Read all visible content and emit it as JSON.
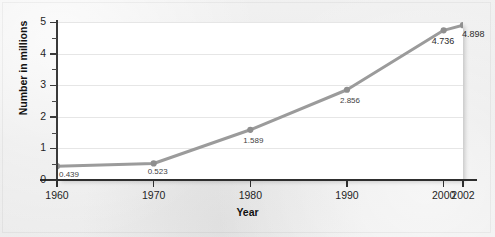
{
  "chart_data": {
    "type": "line",
    "title": "",
    "xlabel": "Year",
    "ylabel": "Number in millions",
    "x": [
      1960,
      1970,
      1980,
      1990,
      2000,
      2002
    ],
    "categories": [
      "1960",
      "1970",
      "1980",
      "1990",
      "2000",
      "2002"
    ],
    "values": [
      0.439,
      0.523,
      1.589,
      2.856,
      4.736,
      4.898
    ],
    "point_labels": [
      "0.439",
      "0.523",
      "1.589",
      "2.856",
      "4.736",
      "4.898"
    ],
    "xlim": [
      1960,
      2002
    ],
    "ylim": [
      0,
      5
    ],
    "y_ticks": [
      0,
      1,
      2,
      3,
      4,
      5
    ],
    "y_tick_labels": [
      "0",
      "1",
      "2",
      "3",
      "4",
      "5"
    ],
    "y_minor_ticks": [
      0.5,
      1.5,
      2.5,
      3.5,
      4.5
    ],
    "x_ticks": [
      1960,
      1970,
      1980,
      1990,
      2000,
      2002
    ],
    "x_tick_labels": [
      "1960",
      "1970",
      "1980",
      "1990",
      "2000",
      "2002"
    ],
    "grid": "horizontal",
    "legend": "none",
    "series": [
      {
        "name": "",
        "values": [
          0.439,
          0.523,
          1.589,
          2.856,
          4.736,
          4.898
        ],
        "line_color": "#9b9b9b",
        "marker_color": "#8f8f8f",
        "marker": "circle"
      }
    ]
  },
  "figure": {
    "plot_background": "#ffffff",
    "page_background": "#ececec",
    "gridline_color": "#e6e6e6",
    "axis_color": "#2e2e2e",
    "label_color": "#1f1f1f"
  },
  "artifacts": {
    "watermark_text": "",
    "watermark_text_2": ""
  }
}
